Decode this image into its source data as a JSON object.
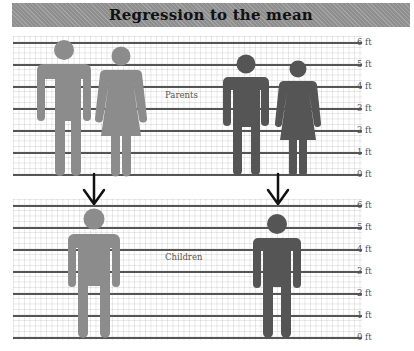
{
  "title": "Regression to the mean",
  "colors": {
    "tall_family": "#8c8c8c",
    "short_family": "#555555",
    "arrow": "#111111",
    "title_bar": "#8f8f8f"
  },
  "panels": {
    "parents": {
      "label": "Parents",
      "ticks": [
        "6 ft",
        "5 ft",
        "4 ft",
        "3 ft",
        "2 ft",
        "1 ft",
        "0 ft"
      ],
      "figures": [
        {
          "name": "tall-father",
          "height_ft": 6.0,
          "color": "tall"
        },
        {
          "name": "tall-mother",
          "height_ft": 5.6,
          "color": "tall"
        },
        {
          "name": "short-father",
          "height_ft": 5.5,
          "color": "short"
        },
        {
          "name": "short-mother",
          "height_ft": 5.0,
          "color": "short"
        }
      ]
    },
    "children": {
      "label": "Children",
      "ticks": [
        "6 ft",
        "5 ft",
        "4 ft",
        "3 ft",
        "2 ft",
        "1 ft",
        "0 ft"
      ],
      "figures": [
        {
          "name": "child-of-tall-parents",
          "height_ft": 5.9,
          "color": "tall"
        },
        {
          "name": "child-of-short-parents",
          "height_ft": 5.7,
          "color": "short"
        }
      ]
    }
  }
}
